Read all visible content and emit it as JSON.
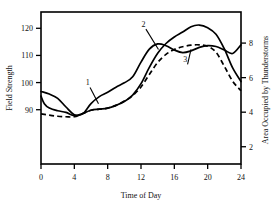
{
  "chart_data": {
    "type": "line",
    "title": "",
    "xlabel": "Time of Day",
    "ylabel": "Field Strength",
    "y2label": "Area Occupied by Thunderstorms",
    "xlim": [
      0,
      24
    ],
    "ylim": [
      70,
      126
    ],
    "y2lim": [
      1.0,
      9.8
    ],
    "xticks": [
      0,
      4,
      8,
      12,
      16,
      20,
      24
    ],
    "xtick_labels": [
      "0",
      "4",
      "8",
      "12",
      "16",
      "20",
      "24"
    ],
    "yticks": [
      90,
      100,
      110,
      120
    ],
    "ytick_labels": [
      "90",
      "100",
      "110",
      "120"
    ],
    "y2ticks": [
      2,
      4,
      6,
      8
    ],
    "y2tick_labels": [
      "2",
      "4",
      "6",
      "8"
    ],
    "grid": false,
    "legend": "inline-curve-numbers",
    "annotations": [
      {
        "text": "1",
        "target_series": "1",
        "x": 5.6,
        "y": 99.0
      },
      {
        "text": "2",
        "target_series": "2",
        "x": 12.3,
        "y": 120.5
      },
      {
        "text": "3",
        "target_series": "3",
        "x": 17.3,
        "y": 6.9
      }
    ],
    "series": [
      {
        "name": "1",
        "axis": "left",
        "style": "dashed",
        "x": [
          0,
          1,
          2,
          3,
          4,
          5,
          6,
          7,
          8,
          9,
          10,
          11,
          12,
          13,
          14,
          15,
          16,
          17,
          18,
          19,
          20,
          21,
          22,
          23,
          24
        ],
        "values": [
          88.5,
          88.0,
          87.6,
          87.4,
          87.4,
          88.6,
          89.8,
          90.2,
          90.6,
          91.6,
          93.2,
          95.2,
          98.4,
          103.0,
          107.4,
          110.4,
          112.2,
          113.2,
          113.8,
          113.9,
          113.4,
          111.2,
          106.0,
          100.5,
          97.0
        ]
      },
      {
        "name": "2",
        "axis": "left",
        "style": "solid",
        "x": [
          0,
          0.4,
          1,
          2,
          3,
          4,
          5,
          6,
          7,
          8,
          9,
          10,
          11,
          12,
          13,
          14,
          15,
          16,
          17,
          18,
          19,
          20,
          21,
          22,
          23,
          24
        ],
        "values": [
          95.0,
          92.2,
          90.6,
          89.6,
          89.0,
          87.8,
          88.6,
          89.8,
          90.2,
          90.6,
          91.6,
          93.0,
          95.4,
          99.6,
          105.6,
          110.8,
          114.4,
          116.8,
          118.6,
          120.6,
          121.2,
          120.2,
          117.8,
          112.4,
          105.4,
          100.4
        ]
      },
      {
        "name": "3",
        "axis": "right",
        "style": "solid",
        "x": [
          0,
          1,
          2,
          3,
          4,
          5,
          6,
          7,
          8,
          9,
          10,
          11,
          12,
          13,
          14,
          15,
          16,
          17,
          18,
          19,
          20,
          21,
          22,
          23,
          24
        ],
        "values": [
          5.2,
          5.05,
          4.8,
          4.3,
          3.85,
          3.9,
          4.5,
          4.9,
          5.15,
          5.45,
          5.7,
          6.05,
          6.9,
          7.65,
          7.95,
          7.85,
          7.6,
          7.45,
          7.55,
          7.75,
          7.85,
          7.8,
          7.6,
          7.4,
          7.9
        ]
      }
    ]
  },
  "axes": {
    "left_title": "Field Strength",
    "right_title": "Area Occupied by Thunderstorms",
    "bottom_title": "Time of Day"
  }
}
